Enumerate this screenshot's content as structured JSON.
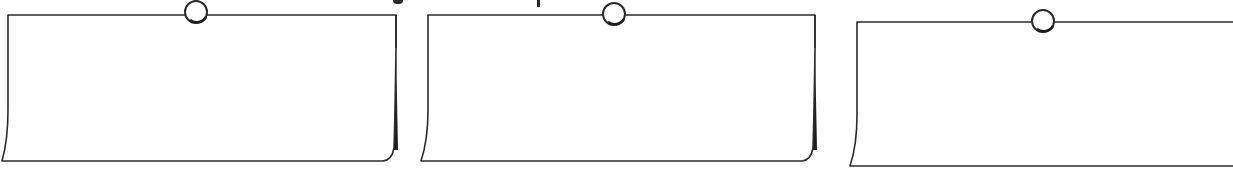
{
  "colors": {
    "stroke": "#2b2b2b",
    "paper": "#ffffff",
    "shadow": "#1e1e1e",
    "pin_fill": "#ffffff"
  },
  "cards": [
    {
      "id": "note-1",
      "content": "",
      "pin": {
        "cx": 196,
        "cy": 12,
        "r": 11
      }
    },
    {
      "id": "note-2",
      "content": "",
      "pin": {
        "cx": 614,
        "cy": 14,
        "r": 11
      }
    },
    {
      "id": "note-3",
      "content": "",
      "pin": {
        "cx": 1043,
        "cy": 21,
        "r": 11
      }
    }
  ]
}
